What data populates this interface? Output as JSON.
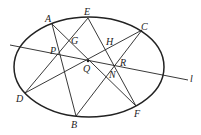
{
  "diagram": {
    "type": "geometry",
    "points": [
      {
        "label": "A"
      },
      {
        "label": "E"
      },
      {
        "label": "C"
      },
      {
        "label": "D"
      },
      {
        "label": "B"
      },
      {
        "label": "F"
      },
      {
        "label": "P"
      },
      {
        "label": "G"
      },
      {
        "label": "Q"
      },
      {
        "label": "H"
      },
      {
        "label": "R"
      },
      {
        "label": "N"
      }
    ],
    "line_label": "l",
    "segments": [
      "AB",
      "AF",
      "ED",
      "EF",
      "CD",
      "CB"
    ],
    "stroke_color": "#222222"
  }
}
